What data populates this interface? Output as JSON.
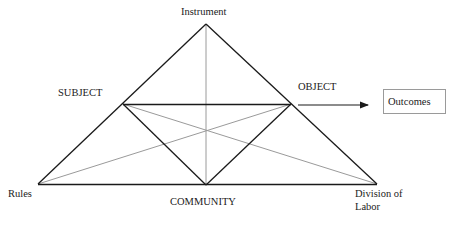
{
  "diagram": {
    "nodes": {
      "instrument": "Instrument",
      "subject": "SUBJECT",
      "object": "OBJECT",
      "rules": "Rules",
      "community": "COMMUNITY",
      "division_line1": "Division of",
      "division_line2": "Labor",
      "outcomes": "Outcomes"
    },
    "colors": {
      "main_line": "#1a1a1a",
      "secondary_line": "#9a9a9a",
      "box_border": "#9a9a9a"
    },
    "edges": [
      {
        "from": "Instrument",
        "to": "Rules",
        "style": "dark"
      },
      {
        "from": "Instrument",
        "to": "Division of Labor",
        "style": "dark"
      },
      {
        "from": "Rules",
        "to": "Division of Labor",
        "style": "dark"
      },
      {
        "from": "SUBJECT",
        "to": "OBJECT",
        "style": "dark"
      },
      {
        "from": "SUBJECT",
        "to": "COMMUNITY",
        "style": "dark"
      },
      {
        "from": "OBJECT",
        "to": "COMMUNITY",
        "style": "dark"
      },
      {
        "from": "Instrument",
        "to": "COMMUNITY",
        "style": "light"
      },
      {
        "from": "SUBJECT",
        "to": "Division of Labor",
        "style": "light"
      },
      {
        "from": "OBJECT",
        "to": "Rules",
        "style": "light"
      },
      {
        "from": "OBJECT",
        "to": "Outcomes",
        "style": "arrow"
      }
    ]
  }
}
